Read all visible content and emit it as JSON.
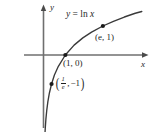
{
  "figure": {
    "background_color": "#ffffff",
    "ink_color": "#1f1f1f",
    "axis_label_x": "x",
    "axis_label_y": "y",
    "curve_equation_lhs": "y",
    "curve_equation_eq": "=",
    "curve_equation_fn": "ln",
    "curve_equation_arg": "x",
    "point_label_e": "(e, 1)",
    "point_label_one_zero": "(1, 0)",
    "point_label_inv_e_open": "(",
    "point_label_inv_e_num": "1",
    "point_label_inv_e_den": "e",
    "point_label_inv_e_comma": ",",
    "point_label_inv_e_y": "−1",
    "point_label_inv_e_close": ")"
  },
  "chart_data": {
    "type": "line",
    "xlabel": "x",
    "ylabel": "y",
    "grid": false,
    "legend": "none",
    "xlim": [
      0,
      4.6
    ],
    "ylim": [
      -3.2,
      1.6
    ],
    "series": [
      {
        "name": "y = ln x",
        "expression": "y = ln x",
        "x": [
          0.045,
          0.06,
          0.08,
          0.11,
          0.15,
          0.2,
          0.27,
          0.3679,
          0.5,
          0.68,
          1.0,
          1.4,
          1.8,
          2.2,
          2.7183,
          3.2,
          3.7,
          4.2,
          4.5
        ],
        "y": [
          -3.1,
          -2.81,
          -2.53,
          -2.21,
          -1.9,
          -1.61,
          -1.31,
          -1.0,
          -0.69,
          -0.39,
          0.0,
          0.34,
          0.59,
          0.79,
          1.0,
          1.16,
          1.31,
          1.44,
          1.5
        ]
      }
    ],
    "points": [
      {
        "label": "(1/e, -1)",
        "x": 0.3679,
        "y": -1
      },
      {
        "label": "(1, 0)",
        "x": 1,
        "y": 0
      },
      {
        "label": "(e, 1)",
        "x": 2.7183,
        "y": 1
      }
    ],
    "annotations": [
      {
        "text": "y = ln x",
        "x": 1.6,
        "y": 1.45
      },
      {
        "text": "(e, 1)",
        "x": 3.05,
        "y": 0.72
      },
      {
        "text": "(1, 0)",
        "x": 1.1,
        "y": -0.28
      },
      {
        "text": "(1/e, -1)",
        "x": 0.6,
        "y": -1.1
      }
    ]
  }
}
